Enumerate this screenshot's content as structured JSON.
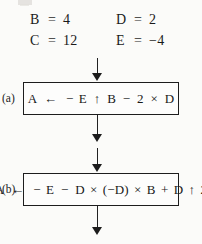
{
  "figure": {
    "variables": {
      "rows": [
        {
          "left": {
            "name": "B",
            "eq": "=",
            "value": "4"
          },
          "right": {
            "name": "D",
            "eq": "=",
            "value": "2"
          }
        },
        {
          "left": {
            "name": "C",
            "eq": "=",
            "value": "12"
          },
          "right": {
            "name": "E",
            "eq": "=",
            "value": "−4"
          }
        }
      ]
    },
    "steps": [
      {
        "label": "(a)",
        "expression": "A ← − E ↑ B − 2 × D",
        "tokens": {
          "target": "A",
          "assign": "←",
          "unary_minus": "−",
          "operand_1": "E",
          "op_1": "↑",
          "operand_2": "B",
          "op_2": "−",
          "operand_3": "2",
          "op_3": "×",
          "operand_4": "D"
        }
      },
      {
        "label": "(b)",
        "expression": "A ← − E − D × (−D) × B + D ↑ 2",
        "tokens": {
          "target": "A",
          "assign": "←",
          "unary_minus": "−",
          "operand_1": "E",
          "op_1": "−",
          "operand_2": "D",
          "op_2": "×",
          "operand_3": "(−D)",
          "op_3": "×",
          "operand_4": "B",
          "op_4": "+",
          "operand_5": "D",
          "op_5": "↑",
          "operand_6": "2"
        }
      }
    ],
    "connectors": [
      {
        "name": "arrow-into-box-a"
      },
      {
        "name": "arrow-out-of-box-a"
      },
      {
        "name": "arrow-into-box-b"
      },
      {
        "name": "arrow-out-of-box-b"
      }
    ]
  }
}
